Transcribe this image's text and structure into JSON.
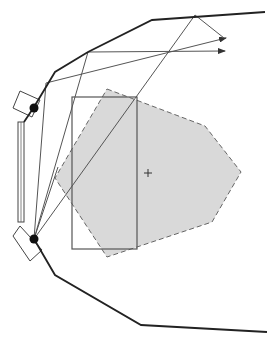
{
  "diagram": {
    "title": "",
    "colors": {
      "background": "#ffffff",
      "boundary": "#222222",
      "ray": "#555555",
      "rectangle": "#555555",
      "region_fill": "#d9d9d9",
      "region_stroke": "#666666",
      "dot": "#111111"
    },
    "boundary_top": [
      [
        24,
        122
      ],
      [
        34,
        107
      ],
      [
        55,
        72
      ],
      [
        88,
        52
      ],
      [
        152,
        20
      ],
      [
        265,
        12
      ]
    ],
    "boundary_bottom": [
      [
        34,
        239
      ],
      [
        55,
        275
      ],
      [
        141,
        325
      ],
      [
        267,
        332
      ]
    ],
    "sources": [
      {
        "name": "upper-source",
        "x": 34,
        "y": 108,
        "r": 4.5
      },
      {
        "name": "lower-source",
        "x": 34,
        "y": 239,
        "r": 4.5
      }
    ],
    "upper_housing": [
      [
        13,
        108
      ],
      [
        20,
        91
      ],
      [
        40,
        100
      ],
      [
        32,
        117
      ]
    ],
    "lower_housing": [
      [
        13,
        236
      ],
      [
        20,
        226
      ],
      [
        42,
        250
      ],
      [
        30,
        261
      ]
    ],
    "vertical_bar": {
      "x": 18,
      "y": 122,
      "w": 6,
      "h": 100
    },
    "target_rect": {
      "x": 72,
      "y": 97,
      "w": 65,
      "h": 152
    },
    "region_polygon": [
      [
        107,
        89
      ],
      [
        205,
        126
      ],
      [
        241,
        172
      ],
      [
        212,
        222
      ],
      [
        107,
        257
      ],
      [
        55,
        178
      ]
    ],
    "center_marker": {
      "x": 148,
      "y": 173
    },
    "rays": [
      {
        "points": [
          [
            34,
            239
          ],
          [
            46,
            83
          ],
          [
            226,
            38
          ]
        ],
        "arrow": true
      },
      {
        "points": [
          [
            34,
            239
          ],
          [
            88,
            52
          ],
          [
            225,
            51
          ]
        ],
        "arrow": true
      },
      {
        "points": [
          [
            34,
            239
          ],
          [
            195,
            15
          ],
          [
            224,
            38
          ]
        ],
        "arrow": false
      },
      {
        "points": [
          [
            34,
            239
          ],
          [
            58,
            167
          ]
        ],
        "arrow": false
      }
    ]
  }
}
